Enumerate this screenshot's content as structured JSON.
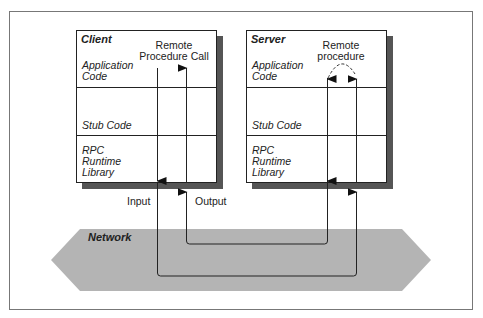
{
  "diagram": {
    "client": {
      "title": "Client",
      "sections": [
        {
          "label_lines": [
            "Application",
            "Code"
          ]
        },
        {
          "label_lines": [
            "Stub Code"
          ]
        },
        {
          "label_lines": [
            "RPC",
            "Runtime",
            "Library"
          ]
        }
      ],
      "annotation_lines": [
        "Remote",
        "Procedure Call"
      ]
    },
    "server": {
      "title": "Server",
      "sections": [
        {
          "label_lines": [
            "Application",
            "Code"
          ]
        },
        {
          "label_lines": [
            "Stub Code"
          ]
        },
        {
          "label_lines": [
            "RPC",
            "Runtime",
            "Library"
          ]
        }
      ],
      "annotation_lines": [
        "Remote",
        "procedure"
      ]
    },
    "flows": {
      "input_label": "Input",
      "output_label": "Output"
    },
    "network": {
      "label": "Network",
      "color": "#b4b4b4"
    },
    "colors": {
      "line": "#222222",
      "shadow": "#555555",
      "frame": "#777777"
    }
  }
}
